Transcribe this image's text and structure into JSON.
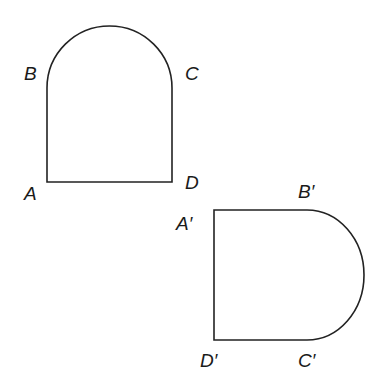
{
  "diagram": {
    "original_shape": {
      "labels": {
        "A": "A",
        "B": "B",
        "C": "C",
        "D": "D"
      }
    },
    "image_shape": {
      "labels": {
        "A": "A′",
        "B": "B′",
        "C": "C′",
        "D": "D′"
      }
    },
    "colors": {
      "stroke": "#222222",
      "background": "#ffffff"
    }
  }
}
